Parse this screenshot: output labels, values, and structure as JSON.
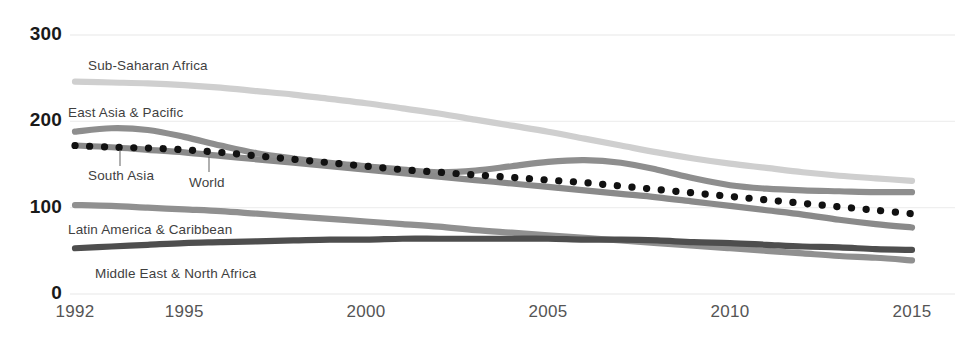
{
  "chart_data": {
    "type": "line",
    "title": "",
    "subtitle": "",
    "xlabel": "",
    "ylabel": "",
    "xlim": [
      1992,
      2015
    ],
    "ylim": [
      0,
      300
    ],
    "grid": true,
    "legend_position": "inline-labels",
    "x_ticks": [
      "1992",
      "1995",
      "2000",
      "2005",
      "2010",
      "2015"
    ],
    "x_tick_values": [
      1992,
      1995,
      2000,
      2005,
      2010,
      2015
    ],
    "y_ticks": [
      "0",
      "100",
      "200",
      "300"
    ],
    "y_tick_values": [
      0,
      100,
      200,
      300
    ],
    "x": [
      1992,
      1993,
      1994,
      1995,
      1996,
      1997,
      1998,
      1999,
      2000,
      2001,
      2002,
      2003,
      2004,
      2005,
      2006,
      2007,
      2008,
      2009,
      2010,
      2011,
      2012,
      2013,
      2014,
      2015
    ],
    "series": [
      {
        "name": "Sub-Saharan Africa",
        "color": "#cfcfcf",
        "style": "solid",
        "label_x": 88,
        "label_y": 58,
        "values": [
          246,
          245,
          244,
          242,
          239,
          235,
          231,
          226,
          221,
          215,
          209,
          202,
          195,
          188,
          180,
          172,
          164,
          157,
          151,
          146,
          141,
          137,
          134,
          131
        ]
      },
      {
        "name": "East Asia & Pacific",
        "color": "#8e8e8e",
        "style": "solid",
        "label_x": 68,
        "label_y": 105,
        "values": [
          188,
          192,
          190,
          182,
          172,
          163,
          157,
          152,
          148,
          144,
          141,
          143,
          148,
          153,
          155,
          152,
          144,
          134,
          126,
          122,
          120,
          119,
          118,
          118
        ]
      },
      {
        "name": "South Asia",
        "color": "#8a8a8a",
        "style": "solid",
        "label_x": 88,
        "label_y": 168,
        "leader_x": 120,
        "leader_y1": 150,
        "leader_y2": 166,
        "values": [
          172,
          170,
          167,
          164,
          160,
          156,
          152,
          148,
          144,
          140,
          136,
          132,
          128,
          124,
          120,
          116,
          112,
          107,
          102,
          97,
          92,
          86,
          81,
          77
        ]
      },
      {
        "name": "World",
        "color": "#111111",
        "style": "dotted",
        "label_x": 189,
        "label_y": 175,
        "leader_x": 209,
        "leader_y1": 157,
        "leader_y2": 172,
        "values": [
          172,
          170,
          169,
          167,
          164,
          160,
          156,
          152,
          148,
          144,
          141,
          138,
          135,
          132,
          129,
          125,
          121,
          117,
          113,
          109,
          105,
          101,
          97,
          93
        ]
      },
      {
        "name": "Latin America & Caribbean",
        "color": "#909090",
        "style": "solid",
        "label_x": 68,
        "label_y": 222,
        "values": [
          103,
          102,
          100,
          98,
          96,
          93,
          90,
          87,
          84,
          81,
          78,
          74,
          71,
          68,
          65,
          62,
          59,
          56,
          53,
          50,
          47,
          44,
          42,
          39
        ]
      },
      {
        "name": "Middle East & North Africa",
        "color": "#4e4e4e",
        "style": "solid",
        "label_x": 95,
        "label_y": 266,
        "values": [
          53,
          55,
          57,
          59,
          60,
          61,
          62,
          63,
          63,
          64,
          64,
          64,
          64,
          64,
          63,
          63,
          62,
          60,
          59,
          57,
          55,
          54,
          52,
          51
        ]
      }
    ]
  },
  "axis": {
    "y_label_color": "#1a1a1a",
    "x_label_color": "#555555",
    "grid_color": "#efefef"
  }
}
